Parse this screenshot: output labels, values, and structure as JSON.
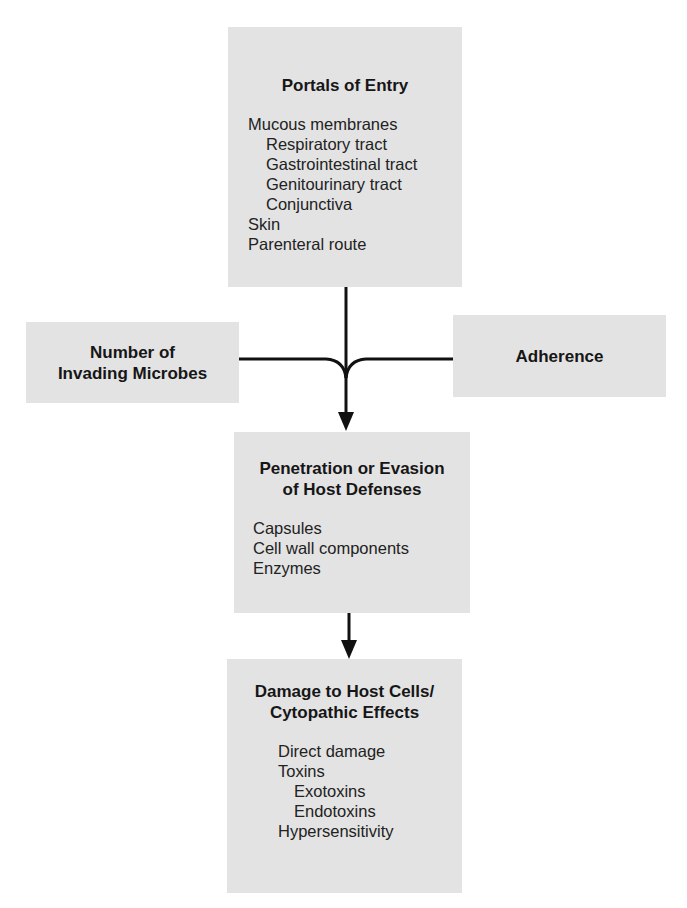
{
  "diagram": {
    "nodes": {
      "portals_of_entry": {
        "title": "Portals of Entry",
        "items": [
          {
            "label": "Mucous membranes",
            "level": 1
          },
          {
            "label": "Respiratory tract",
            "level": 2
          },
          {
            "label": "Gastrointestinal tract",
            "level": 2
          },
          {
            "label": "Genitourinary tract",
            "level": 2
          },
          {
            "label": "Conjunctiva",
            "level": 2
          },
          {
            "label": "Skin",
            "level": 1
          },
          {
            "label": "Parenteral route",
            "level": 1
          }
        ]
      },
      "number_of_invading_microbes": {
        "title_line1": "Number of",
        "title_line2": "Invading Microbes"
      },
      "adherence": {
        "title": "Adherence"
      },
      "penetration_or_evasion": {
        "title_line1": "Penetration or Evasion",
        "title_line2": "of Host Defenses",
        "items": [
          {
            "label": "Capsules",
            "level": 1
          },
          {
            "label": "Cell wall components",
            "level": 1
          },
          {
            "label": "Enzymes",
            "level": 1
          }
        ]
      },
      "damage_to_host_cells": {
        "title_line1": "Damage to Host Cells/",
        "title_line2": "Cytopathic Effects",
        "items": [
          {
            "label": "Direct damage",
            "level": 1
          },
          {
            "label": "Toxins",
            "level": 2
          },
          {
            "label": "Exotoxins",
            "level": 3
          },
          {
            "label": "Endotoxins",
            "level": 3
          },
          {
            "label": "Hypersensitivity",
            "level": 2
          }
        ]
      }
    },
    "edges": [
      {
        "from": "Portals of Entry",
        "to": "Penetration or Evasion of Host Defenses"
      },
      {
        "from": "Number of Invading Microbes",
        "to": "Penetration or Evasion of Host Defenses"
      },
      {
        "from": "Adherence",
        "to": "Penetration or Evasion of Host Defenses"
      },
      {
        "from": "Penetration or Evasion of Host Defenses",
        "to": "Damage to Host Cells/Cytopathic Effects"
      }
    ],
    "colors": {
      "box_fill": "#e3e3e3",
      "line": "#111111",
      "background": "#ffffff"
    }
  }
}
